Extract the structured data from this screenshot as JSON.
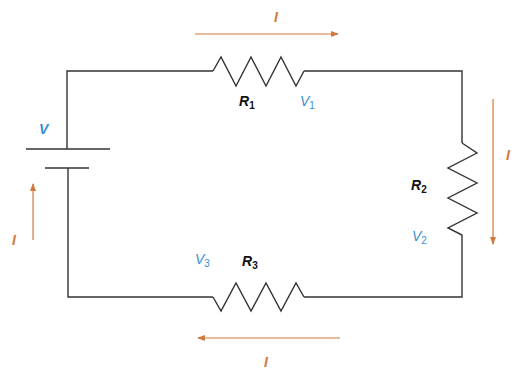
{
  "diagram": {
    "type": "series-circuit",
    "colors": {
      "wire": "#333333",
      "current": "#d2783c",
      "voltage": "#3b8fd0",
      "resistor_label": "#111111"
    },
    "source": {
      "label": "V"
    },
    "resistors": [
      {
        "name": "R",
        "sub": "1",
        "voltage": "V",
        "voltage_sub": "1",
        "position": "top"
      },
      {
        "name": "R",
        "sub": "2",
        "voltage": "V",
        "voltage_sub": "2",
        "position": "right"
      },
      {
        "name": "R",
        "sub": "3",
        "voltage": "V",
        "voltage_sub": "3",
        "position": "bottom"
      }
    ],
    "currents": [
      {
        "label": "I",
        "direction": "right",
        "position": "top"
      },
      {
        "label": "I",
        "direction": "down",
        "position": "right"
      },
      {
        "label": "I",
        "direction": "left",
        "position": "bottom"
      },
      {
        "label": "I",
        "direction": "up",
        "position": "left"
      }
    ]
  }
}
